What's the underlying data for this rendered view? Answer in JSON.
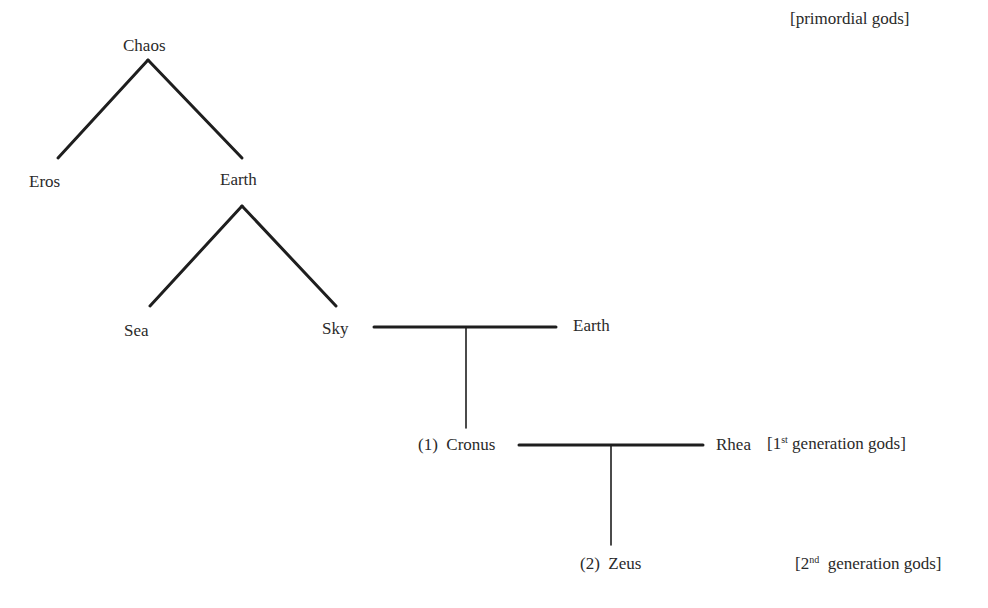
{
  "diagram": {
    "nodes": {
      "chaos": "Chaos",
      "eros": "Eros",
      "earth_1": "Earth",
      "sea": "Sea",
      "sky": "Sky",
      "earth_2": "Earth",
      "cronus_num": "(1)",
      "cronus": "Cronus",
      "rhea": "Rhea",
      "zeus_num": "(2)",
      "zeus": "Zeus"
    },
    "annotations": {
      "primordial": "[primordial gods]",
      "first_gen_open": "[1",
      "first_gen_sup": "st",
      "first_gen_rest": " generation gods]",
      "second_gen_open": "[2",
      "second_gen_sup": "nd",
      "second_gen_rest": "  generation gods]"
    },
    "edges": [
      {
        "from": "Chaos",
        "to": "Eros",
        "type": "descent"
      },
      {
        "from": "Chaos",
        "to": "Earth",
        "type": "descent"
      },
      {
        "from": "Earth",
        "to": "Sea",
        "type": "descent"
      },
      {
        "from": "Earth",
        "to": "Sky",
        "type": "descent"
      },
      {
        "from": "Sky",
        "to": "Earth",
        "type": "union"
      },
      {
        "from": "Sky+Earth",
        "to": "Cronus",
        "type": "offspring"
      },
      {
        "from": "Cronus",
        "to": "Rhea",
        "type": "union"
      },
      {
        "from": "Cronus+Rhea",
        "to": "Zeus",
        "type": "offspring"
      }
    ]
  }
}
